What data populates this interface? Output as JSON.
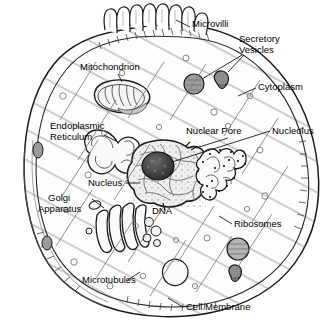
{
  "figure": {
    "width": 335,
    "height": 332,
    "style": "black-and-white line drawing with pencil hatching",
    "background_color": "#ffffff",
    "line_color": "#1a1a1a"
  },
  "labels": {
    "microvilli": "Microvilli",
    "secretory_vesicles_line1": "Secretory",
    "secretory_vesicles_line2": "Vesicles",
    "cytoplasm": "Cytoplasm",
    "nucleolus": "Nucleolus",
    "nuclear_pore": "Nuclear Pore",
    "mitochondrion": "Mitochondrion",
    "endoplasmic_line1": "Endoplasmic",
    "endoplasmic_line2": "Reticulum",
    "nucleus": "Nucleus",
    "golgi_line1": "Golgi",
    "golgi_line2": "Apparatus",
    "dna": "DNA",
    "ribosomes": "Ribosomes",
    "microtubules": "Microtubules",
    "cell_membrane": "Cell Membrane"
  },
  "structures": [
    {
      "name": "cell-membrane",
      "label": "Cell Membrane",
      "description": "double outline enclosing the whole cell with tick hatching"
    },
    {
      "name": "microvilli",
      "label": "Microvilli",
      "description": "finger-like projections on upper membrane",
      "count": 8
    },
    {
      "name": "secretory-vesicles",
      "label": "Secretory Vesicles",
      "description": "round vesicles fusing with membrane",
      "count": 2
    },
    {
      "name": "cytoplasm",
      "label": "Cytoplasm",
      "description": "hatched interior fluid"
    },
    {
      "name": "nucleus",
      "label": "Nucleus",
      "description": "large lobed organelle at center"
    },
    {
      "name": "nucleolus",
      "label": "Nucleolus",
      "description": "dark round body inside nucleus"
    },
    {
      "name": "nuclear-pore",
      "label": "Nuclear Pore",
      "description": "gap in nuclear envelope"
    },
    {
      "name": "dna",
      "label": "DNA",
      "description": "chromatin threads in nucleus"
    },
    {
      "name": "mitochondrion",
      "label": "Mitochondrion",
      "description": "bean-shaped organelle with cristae"
    },
    {
      "name": "endoplasmic-reticulum",
      "label": "Endoplasmic Reticulum",
      "description": "folded smooth membrane network left of nucleus"
    },
    {
      "name": "rough-er-ribosomes",
      "label": "Ribosomes",
      "description": "dotted rough ER right of nucleus"
    },
    {
      "name": "golgi-apparatus",
      "label": "Golgi Apparatus",
      "description": "stack of curved flattened sacs"
    },
    {
      "name": "microtubules",
      "label": "Microtubules",
      "description": "thin diagonal filaments through cytoplasm"
    },
    {
      "name": "vacuole",
      "label": "",
      "description": "large pale round vesicle lower centre"
    }
  ],
  "label_positions": {
    "microvilli": {
      "x": 192,
      "y": 25
    },
    "secretory_vesicles": {
      "x": 240,
      "y": 40
    },
    "cytoplasm": {
      "x": 258,
      "y": 87
    },
    "nucleolus": {
      "x": 272,
      "y": 128
    },
    "nuclear_pore": {
      "x": 188,
      "y": 128
    },
    "mitochondrion": {
      "x": 81,
      "y": 63
    },
    "endoplasmic_reticulum": {
      "x": 51,
      "y": 119
    },
    "nucleus": {
      "x": 90,
      "y": 180
    },
    "golgi_apparatus": {
      "x": 48,
      "y": 192
    },
    "dna": {
      "x": 153,
      "y": 205
    },
    "ribosomes": {
      "x": 233,
      "y": 222
    },
    "microtubules": {
      "x": 82,
      "y": 277
    },
    "cell_membrane": {
      "x": 185,
      "y": 305
    }
  }
}
